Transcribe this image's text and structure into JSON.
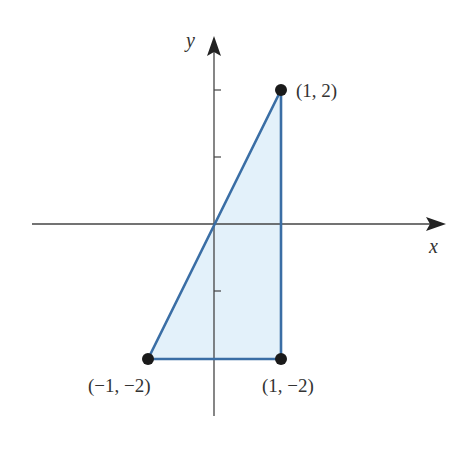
{
  "figure": {
    "axes": {
      "x_label": "x",
      "y_label": "y"
    },
    "points": [
      {
        "label": "(1, 2)",
        "x": 1,
        "y": 2
      },
      {
        "label": "(−1, −2)",
        "x": -1,
        "y": -2
      },
      {
        "label": "(1, −2)",
        "x": 1,
        "y": -2
      }
    ],
    "region": {
      "vertices": [
        [
          0,
          0
        ],
        [
          1,
          2
        ],
        [
          1,
          -2
        ],
        [
          -1,
          -2
        ]
      ],
      "fill": "#e3f1fa",
      "stroke": "#3a6ea5"
    },
    "ticks": {
      "y": [
        2,
        1,
        -1
      ]
    }
  }
}
